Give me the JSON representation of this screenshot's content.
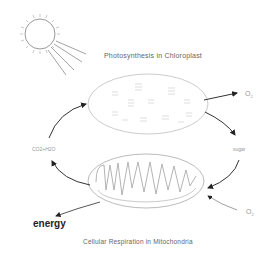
{
  "diagram": {
    "type": "cycle",
    "top_title": "Photosynthesis in Chloroplast",
    "bottom_title": "Cellular Respiration in Mitochondria",
    "labels": {
      "oxygen_out": "O",
      "oxygen_out_sub": "2",
      "oxygen_in": "O",
      "oxygen_in_sub": "2",
      "co2_water": "CO2+H2O",
      "sugar": "sugar",
      "energy": "energy"
    },
    "nodes": [
      {
        "id": "sun",
        "label": "sun"
      },
      {
        "id": "chloroplast",
        "label": "Photosynthesis in Chloroplast"
      },
      {
        "id": "mitochondrion",
        "label": "Cellular Respiration in Mitochondria"
      }
    ],
    "edges": [
      {
        "from": "sun",
        "to": "chloroplast",
        "label": "light"
      },
      {
        "from": "chloroplast",
        "to": "out",
        "label": "O2"
      },
      {
        "from": "chloroplast",
        "to": "mitochondrion",
        "label": "sugar"
      },
      {
        "from": "in",
        "to": "mitochondrion",
        "label": "O2"
      },
      {
        "from": "mitochondrion",
        "to": "chloroplast",
        "label": "CO2+H2O"
      },
      {
        "from": "mitochondrion",
        "to": "out",
        "label": "energy"
      }
    ],
    "colors": {
      "line": "#bbbbbb",
      "arrow": "#333333",
      "text": "#666666"
    }
  }
}
